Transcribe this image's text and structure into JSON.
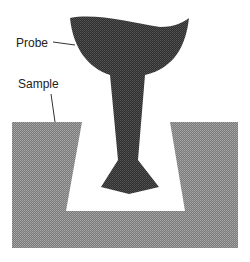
{
  "diagram": {
    "labels": {
      "probe": "Probe",
      "sample": "Sample"
    },
    "colors": {
      "probe_fill": "#3a3a3a",
      "sample_fill": "#8a8a8a",
      "background": "#ffffff",
      "leader_line": "#333333"
    }
  }
}
